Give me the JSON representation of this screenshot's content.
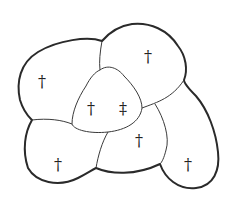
{
  "diagram": {
    "regions": [
      {
        "id": "top-left",
        "symbol": "†"
      },
      {
        "id": "top-right",
        "symbol": "†"
      },
      {
        "id": "center-left",
        "symbol": "†"
      },
      {
        "id": "center-right",
        "symbol": "‡"
      },
      {
        "id": "middle-lower",
        "symbol": "†"
      },
      {
        "id": "bottom-left",
        "symbol": "†"
      },
      {
        "id": "bottom-right",
        "symbol": "†"
      }
    ]
  }
}
